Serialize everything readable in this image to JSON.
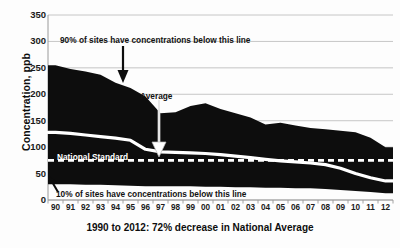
{
  "chart_data": {
    "type": "area",
    "title": "",
    "subtitle": "",
    "xlabel": "1990 to 2012: 72% decrease in National Average",
    "ylabel": "Concentration, ppb",
    "ylim": [
      0,
      350
    ],
    "ytick_step": 50,
    "yticks": [
      0,
      50,
      100,
      150,
      200,
      250,
      300,
      350
    ],
    "grid": true,
    "legend_position": "none",
    "categories": [
      "90",
      "91",
      "92",
      "93",
      "94",
      "95",
      "96",
      "97",
      "98",
      "99",
      "00",
      "01",
      "02",
      "03",
      "04",
      "05",
      "06",
      "07",
      "08",
      "09",
      "10",
      "11",
      "12"
    ],
    "years": [
      1990,
      1991,
      1992,
      1993,
      1994,
      1995,
      1996,
      1997,
      1998,
      1999,
      2000,
      2001,
      2002,
      2003,
      2004,
      2005,
      2006,
      2007,
      2008,
      2009,
      2010,
      2011,
      2012
    ],
    "series": [
      {
        "name": "90th percentile",
        "description": "90% of sites have concentrations below this line",
        "values": [
          255,
          248,
          243,
          237,
          222,
          212,
          196,
          164,
          166,
          178,
          183,
          172,
          164,
          156,
          143,
          146,
          141,
          136,
          134,
          131,
          128,
          118,
          100
        ]
      },
      {
        "name": "Average",
        "description": "National Average concentration",
        "values": [
          128,
          126,
          123,
          120,
          117,
          113,
          96,
          91,
          90,
          89,
          88,
          86,
          83,
          80,
          77,
          74,
          72,
          70,
          67,
          60,
          50,
          42,
          36
        ]
      },
      {
        "name": "10th percentile",
        "description": "10% of sites have concentrations below this line",
        "values": [
          30,
          30,
          29,
          29,
          28,
          27,
          26,
          26,
          26,
          26,
          25,
          25,
          24,
          24,
          23,
          23,
          22,
          22,
          21,
          19,
          17,
          15,
          13
        ]
      },
      {
        "name": "National Standard",
        "description": "National Standard reference level (dashed line)",
        "values": [
          75,
          75,
          75,
          75,
          75,
          75,
          75,
          75,
          75,
          75,
          75,
          75,
          75,
          75,
          75,
          75,
          75,
          75,
          75,
          75,
          75,
          75,
          75
        ]
      }
    ],
    "annotations": [
      {
        "id": "pct90",
        "text": "90% of sites have concentrations below this line",
        "arrow": "down-solid-black",
        "points_to_year": 1994
      },
      {
        "id": "average",
        "text": "Average",
        "arrow": "down-white-outline",
        "points_to_year": 1997
      },
      {
        "id": "standard",
        "text": "National Standard",
        "arrow": "none",
        "points_to_value": 75
      },
      {
        "id": "pct10",
        "text": "10% of sites have concentrations below this line",
        "arrow": "up-left-solid-black",
        "points_to_year": 1990
      }
    ],
    "colors": {
      "band_fill": "#0d0d0d",
      "average_line": "#ffffff",
      "standard_line": "#ffffff",
      "grid": "#bfbfbf",
      "axis": "#808080",
      "text": "#111111",
      "background": "#ffffff"
    }
  },
  "axes": {
    "y_title": "Concentration, ppb",
    "y_tick_labels": [
      "350",
      "300",
      "250",
      "200",
      "150",
      "100",
      "50",
      "0"
    ],
    "x_tick_labels": [
      "90",
      "91",
      "92",
      "93",
      "94",
      "95",
      "96",
      "97",
      "98",
      "99",
      "00",
      "01",
      "02",
      "03",
      "04",
      "05",
      "06",
      "07",
      "08",
      "09",
      "10",
      "11",
      "12"
    ]
  },
  "caption": {
    "text": "1990 to 2012: 72% decrease in National Average"
  },
  "annotations": {
    "pct90_label": "90% of sites have concentrations below this line",
    "average_label": "Average",
    "standard_label": "National Standard",
    "pct10_label": "10% of sites have concentrations below this line"
  }
}
